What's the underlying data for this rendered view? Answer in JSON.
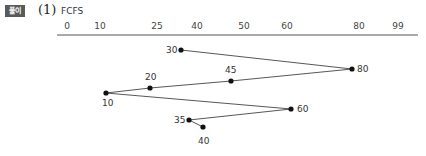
{
  "header": {
    "badge": "풀이",
    "number": "(1)",
    "title": "FCFS"
  },
  "axis": {
    "ticks": [
      {
        "label": "0",
        "x": 67
      },
      {
        "label": "10",
        "x": 100
      },
      {
        "label": "25",
        "x": 157
      },
      {
        "label": "40",
        "x": 197
      },
      {
        "label": "50",
        "x": 244
      },
      {
        "label": "60",
        "x": 287
      },
      {
        "label": "80",
        "x": 359
      },
      {
        "label": "99",
        "x": 398
      }
    ]
  },
  "path": {
    "points": [
      {
        "label": "30",
        "x": 181,
        "y": 50,
        "lx": -15,
        "ly": 3
      },
      {
        "label": "80",
        "x": 352,
        "y": 69,
        "lx": 5,
        "ly": 3
      },
      {
        "label": "45",
        "x": 231,
        "y": 81,
        "lx": -6,
        "ly": -8
      },
      {
        "label": "20",
        "x": 150,
        "y": 88,
        "lx": -5,
        "ly": -8
      },
      {
        "label": "10",
        "x": 106,
        "y": 93,
        "lx": -4,
        "ly": 13
      },
      {
        "label": "60",
        "x": 291,
        "y": 109,
        "lx": 6,
        "ly": 3
      },
      {
        "label": "35",
        "x": 189,
        "y": 120,
        "lx": -15,
        "ly": 3
      },
      {
        "label": "40",
        "x": 203,
        "y": 127,
        "lx": -5,
        "ly": 17
      }
    ]
  }
}
